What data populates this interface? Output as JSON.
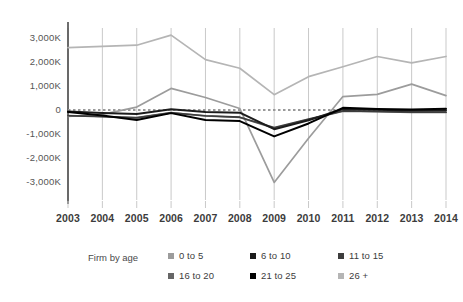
{
  "chart_data": {
    "type": "line",
    "title": "",
    "xlabel": "",
    "ylabel": "",
    "x": [
      2003,
      2004,
      2005,
      2006,
      2007,
      2008,
      2009,
      2010,
      2011,
      2012,
      2013,
      2014
    ],
    "x_tick_labels": [
      "2003",
      "2004",
      "2005",
      "2006",
      "2007",
      "2008",
      "2009",
      "2010",
      "2011",
      "2012",
      "2013",
      "2014"
    ],
    "y_tick_labels": [
      "3,000K",
      "2,000K",
      "1,000K",
      "0",
      "-1,000K",
      "-2,000K",
      "-3,000K"
    ],
    "y_tick_values": [
      3000,
      2000,
      1000,
      0,
      -1000,
      -2000,
      -3000
    ],
    "ylim": [
      -3400,
      3400
    ],
    "y_units": "K",
    "grid": "vertical",
    "zero_reference_line": true,
    "legend_position": "bottom",
    "series": [
      {
        "name": "0 to 5",
        "color": "#9c9c9c",
        "values": [
          -270,
          -180,
          120,
          900,
          520,
          60,
          -3020,
          -1180,
          560,
          650,
          1080,
          600
        ]
      },
      {
        "name": "6 to 10",
        "color": "#1c1c1c",
        "values": [
          -60,
          -120,
          -170,
          30,
          -80,
          -110,
          -800,
          -430,
          40,
          10,
          -20,
          -10
        ]
      },
      {
        "name": "11 to 15",
        "color": "#3d3d3d",
        "values": [
          -240,
          -280,
          -330,
          -120,
          -240,
          -300,
          -730,
          -380,
          -40,
          -60,
          -90,
          -90
        ]
      },
      {
        "name": "16 to 20",
        "color": "#666666",
        "values": [
          -230,
          -270,
          -320,
          -110,
          -250,
          -310,
          -760,
          -400,
          -50,
          -70,
          -100,
          -100
        ]
      },
      {
        "name": "21 to 25",
        "color": "#000000",
        "values": [
          -80,
          -230,
          -420,
          -130,
          -420,
          -460,
          -1100,
          -560,
          90,
          40,
          20,
          50
        ]
      },
      {
        "name": "26 +",
        "color": "#b5b5b5",
        "values": [
          2600,
          2650,
          2700,
          3120,
          2100,
          1740,
          640,
          1390,
          1800,
          2230,
          1960,
          2230
        ]
      }
    ]
  },
  "legend": {
    "title": "Firm by age",
    "items": [
      {
        "label": "0 to 5",
        "color": "#9c9c9c"
      },
      {
        "label": "6 to 10",
        "color": "#1c1c1c"
      },
      {
        "label": "11 to 15",
        "color": "#3d3d3d"
      },
      {
        "label": "16 to 20",
        "color": "#666666"
      },
      {
        "label": "21 to 25",
        "color": "#000000"
      },
      {
        "label": "26 +",
        "color": "#b5b5b5"
      }
    ]
  },
  "axis": {
    "axis_color": "#4a4a4a",
    "grid_color": "#c9c9c9",
    "zero_line_color": "#9a9a9a"
  }
}
